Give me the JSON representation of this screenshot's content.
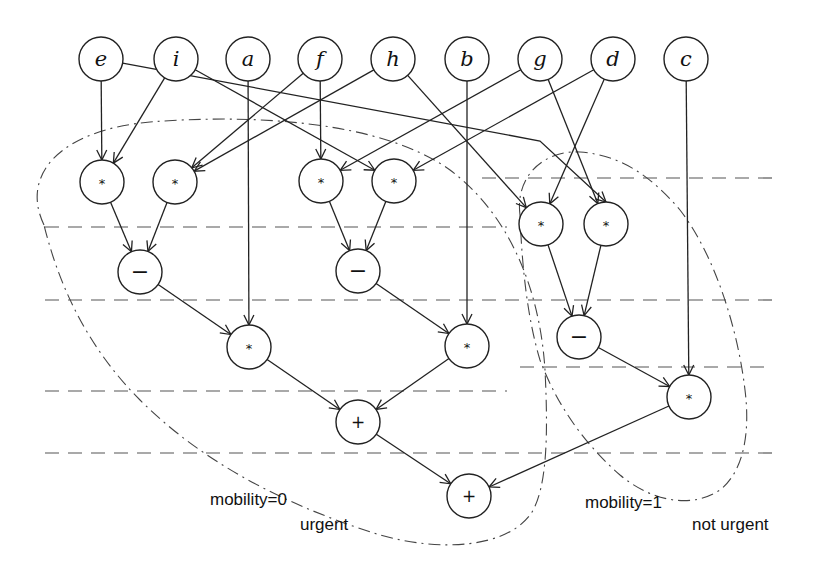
{
  "diagram": {
    "type": "data-flow graph with scheduling steps",
    "inputs": [
      {
        "id": "e",
        "label": "e",
        "x": 101,
        "y": 59
      },
      {
        "id": "i",
        "label": "i",
        "x": 176,
        "y": 59
      },
      {
        "id": "a",
        "label": "a",
        "x": 248,
        "y": 59
      },
      {
        "id": "f",
        "label": "f",
        "x": 320,
        "y": 59
      },
      {
        "id": "h",
        "label": "h",
        "x": 393,
        "y": 59
      },
      {
        "id": "b",
        "label": "b",
        "x": 467,
        "y": 59
      },
      {
        "id": "g",
        "label": "g",
        "x": 540,
        "y": 59
      },
      {
        "id": "d",
        "label": "d",
        "x": 613,
        "y": 59
      },
      {
        "id": "c",
        "label": "c",
        "x": 686,
        "y": 59
      }
    ],
    "operations": [
      {
        "id": "m1",
        "label": "*",
        "kind": "mul",
        "x": 102,
        "y": 182
      },
      {
        "id": "m2",
        "label": "*",
        "kind": "mul",
        "x": 175,
        "y": 182
      },
      {
        "id": "m3",
        "label": "*",
        "kind": "mul",
        "x": 321,
        "y": 181
      },
      {
        "id": "m4",
        "label": "*",
        "kind": "mul",
        "x": 394,
        "y": 181
      },
      {
        "id": "m5",
        "label": "*",
        "kind": "mul",
        "x": 541,
        "y": 224
      },
      {
        "id": "m6",
        "label": "*",
        "kind": "mul",
        "x": 606,
        "y": 224
      },
      {
        "id": "s1",
        "label": "−",
        "kind": "sub",
        "x": 140,
        "y": 272
      },
      {
        "id": "s2",
        "label": "−",
        "kind": "sub",
        "x": 358,
        "y": 271
      },
      {
        "id": "s3",
        "label": "−",
        "kind": "sub",
        "x": 579,
        "y": 337
      },
      {
        "id": "m7",
        "label": "*",
        "kind": "mul",
        "x": 249,
        "y": 347
      },
      {
        "id": "m8",
        "label": "*",
        "kind": "mul",
        "x": 467,
        "y": 346
      },
      {
        "id": "m9",
        "label": "*",
        "kind": "mul",
        "x": 689,
        "y": 397
      },
      {
        "id": "p1",
        "label": "+",
        "kind": "add",
        "x": 358,
        "y": 422
      },
      {
        "id": "p2",
        "label": "+",
        "kind": "add",
        "x": 469,
        "y": 496
      }
    ],
    "edges": [
      [
        "e",
        "m1"
      ],
      [
        "i",
        "m1"
      ],
      [
        "f",
        "m2"
      ],
      [
        "h",
        "m2"
      ],
      [
        "f",
        "m3"
      ],
      [
        "g",
        "m3"
      ],
      [
        "i",
        "m4"
      ],
      [
        "d",
        "m4"
      ],
      [
        "h",
        "m5"
      ],
      [
        "d",
        "m5"
      ],
      [
        "e",
        "m6"
      ],
      [
        "g",
        "m6"
      ],
      [
        "m1",
        "s1"
      ],
      [
        "m2",
        "s1"
      ],
      [
        "m3",
        "s2"
      ],
      [
        "m4",
        "s2"
      ],
      [
        "m5",
        "s3"
      ],
      [
        "m6",
        "s3"
      ],
      [
        "s1",
        "m7"
      ],
      [
        "a",
        "m7"
      ],
      [
        "s2",
        "m8"
      ],
      [
        "b",
        "m8"
      ],
      [
        "s3",
        "m9"
      ],
      [
        "c",
        "m9"
      ],
      [
        "m7",
        "p1"
      ],
      [
        "m8",
        "p1"
      ],
      [
        "p1",
        "p2"
      ],
      [
        "m9",
        "p2"
      ]
    ],
    "bent_edges": {
      "e-m6": [
        [
          101,
          59
        ],
        [
          540,
          141
        ],
        [
          606,
          202
        ]
      ]
    },
    "step_boundaries": [
      {
        "y": 178,
        "x1": 482,
        "x2": 772
      },
      {
        "y": 227,
        "x1": 45,
        "x2": 507
      },
      {
        "y": 300,
        "x1": 45,
        "x2": 772
      },
      {
        "y": 367,
        "x1": 520,
        "x2": 772
      },
      {
        "y": 391,
        "x1": 45,
        "x2": 507
      },
      {
        "y": 453,
        "x1": 45,
        "x2": 772
      }
    ],
    "regions": [
      {
        "id": "urgent-region",
        "mobility_label": "mobility=0",
        "status_label": "urgent"
      },
      {
        "id": "not-urgent-region",
        "mobility_label": "mobility=1",
        "status_label": "not urgent"
      }
    ]
  },
  "annotations": {
    "left_mobility": "mobility=0",
    "left_status": "urgent",
    "right_mobility": "mobility=1",
    "right_status": "not urgent"
  }
}
